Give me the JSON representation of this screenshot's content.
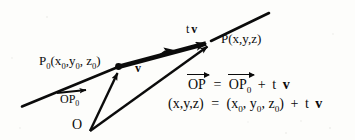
{
  "figure": {
    "type": "vector-line-diagram",
    "background_color": "#fdfdfb",
    "ink_color": "#0b0b0b",
    "labels": {
      "point_p0": {
        "base": "P",
        "sub": "0",
        "coords_open": "(x",
        "x_sub": "0",
        "comma1": ",y",
        "y_sub": "0",
        "comma2": ", z",
        "z_sub": "0",
        "close": ")"
      },
      "point_p0_text": "P0(x0,y0, z0)",
      "direction_vector": "v",
      "scaled_vector_t": "t",
      "scaled_vector_v": "v",
      "point_p_text": "P(x,y,z)",
      "position_vector_op0": "OP",
      "position_vector_op0_sub": "0",
      "origin": "O"
    },
    "equations": {
      "line1": {
        "lhs": "OP",
        "equals": "=",
        "rhs_vec": "OP",
        "rhs_vec_sub": "0",
        "plus": "+",
        "t": "t",
        "v": "v"
      },
      "line2": {
        "lhs": "(x,y,z)",
        "equals": "=",
        "rhs_open": "(x",
        "rhs_x_sub": "0",
        "rhs_mid1": ", y",
        "rhs_y_sub": "0",
        "rhs_mid2": ", z",
        "rhs_z_sub": "0",
        "rhs_close": ")",
        "plus": "+",
        "t": "t",
        "v": "v"
      },
      "line1_plain": "OP = OP0 + t v",
      "line2_plain": "(x,y,z) = (x0, y0, z0) + t v"
    },
    "geometry": {
      "line_start": [
        22,
        106
      ],
      "line_end": [
        269,
        13
      ],
      "point_p0": [
        118,
        67
      ],
      "point_p": [
        211,
        42
      ],
      "origin": [
        90,
        131
      ],
      "vector_v_arrow_tip": [
        201,
        41
      ],
      "mid_arrow": [
        170,
        52
      ]
    }
  }
}
